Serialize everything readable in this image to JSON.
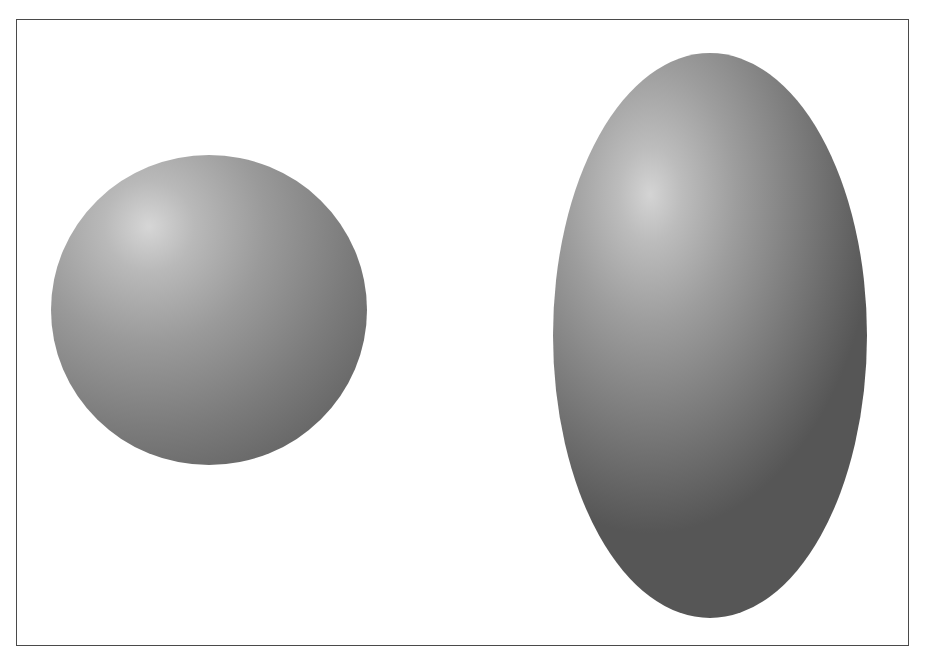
{
  "figure": {
    "frame": {
      "border_color": "#4a4a4a",
      "background": "#ffffff"
    },
    "shapes": [
      {
        "name": "sphere",
        "type": "sphere",
        "shading": "gray radial gradient",
        "highlight_color": "#d6d6d6",
        "shadow_color": "#575757"
      },
      {
        "name": "ellipsoid",
        "type": "prolate ellipsoid (vertical)",
        "shading": "gray radial gradient",
        "highlight_color": "#d4d4d4",
        "shadow_color": "#565656"
      }
    ]
  }
}
